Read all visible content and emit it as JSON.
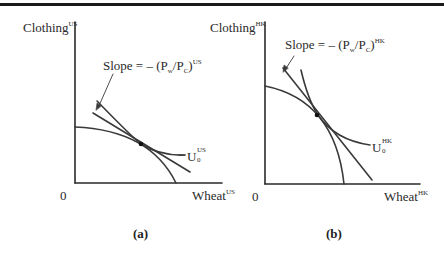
{
  "figure": {
    "panels": [
      {
        "id": "a",
        "caption": "(a)",
        "y_axis_label": "Clothing",
        "y_axis_sup": "US",
        "x_axis_label": "Wheat",
        "x_axis_sup": "US",
        "origin_label": "0",
        "slope_label_prefix": "Slope = – (P",
        "slope_w": "w",
        "slope_mid": "/P",
        "slope_c": "C",
        "slope_suffix": ")",
        "slope_sup": "US",
        "curve_label": "U",
        "curve_sub": "0",
        "curve_sup": "US"
      },
      {
        "id": "b",
        "caption": "(b)",
        "y_axis_label": "Clothing",
        "y_axis_sup": "HK",
        "x_axis_label": "Wheat",
        "x_axis_sup": "HK",
        "origin_label": "0",
        "slope_label_prefix": "Slope = – (P",
        "slope_w": "w",
        "slope_mid": "/P",
        "slope_c": "C",
        "slope_suffix": ")",
        "slope_sup": "HK",
        "curve_label": "U",
        "curve_sub": "0",
        "curve_sup": "HK"
      }
    ],
    "colors": {
      "line": "#3a3a3a",
      "axis": "#2a2a2a",
      "dot": "#111111"
    }
  }
}
